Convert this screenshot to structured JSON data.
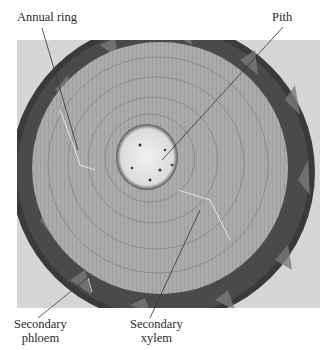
{
  "figure": {
    "labels": {
      "annual_ring": "Annual ring",
      "pith": "Pith",
      "secondary_phloem_line1": "Secondary",
      "secondary_phloem_line2": "phloem",
      "secondary_xylem_line1": "Secondary",
      "secondary_xylem_line2": "xylem"
    },
    "colors": {
      "background": "#d6d6d6",
      "bark": "#3c3c3c",
      "xylem": "#a9a9a9",
      "pith": "#e6e6e6",
      "label_text": "#2a2a2a"
    }
  }
}
